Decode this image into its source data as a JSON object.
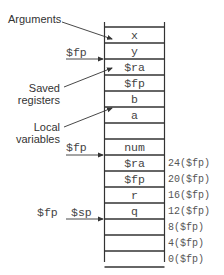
{
  "stack": {
    "cells": [
      "x",
      "y",
      "$ra",
      "$fp",
      "b",
      "a",
      "",
      "num",
      "$ra",
      "$fp",
      "r",
      "q",
      "",
      "",
      ""
    ],
    "offsets": [
      {
        "row_line": 9,
        "label": "24($fp)"
      },
      {
        "row_line": 10,
        "label": "20($fp)"
      },
      {
        "row_line": 11,
        "label": "16($fp)"
      },
      {
        "row_line": 12,
        "label": "12($fp)"
      },
      {
        "row_line": 13,
        "label": "8($fp)"
      },
      {
        "row_line": 14,
        "label": "4($fp)"
      },
      {
        "row_line": 15,
        "label": "0($fp)"
      }
    ]
  },
  "annotations": {
    "arguments": "Arguments",
    "saved_registers": [
      "Saved",
      "registers"
    ],
    "local_variables": [
      "Local",
      "variables"
    ]
  },
  "pointers": {
    "old_fp": "$fp",
    "new_fp": "$fp",
    "bottom_fp": "$fp",
    "bottom_sp": "$sp"
  },
  "colors": {
    "line": "#333333",
    "text": "#444444",
    "background": "#ffffff"
  }
}
